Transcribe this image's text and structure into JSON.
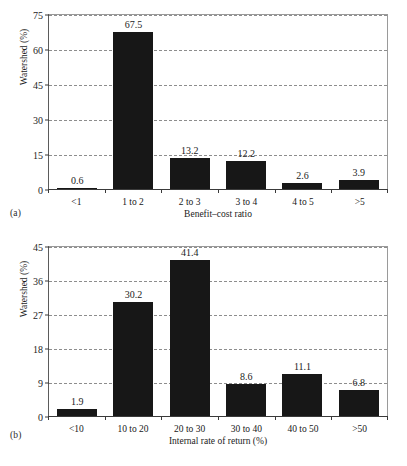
{
  "chart_data": [
    {
      "type": "bar",
      "panel": "(a)",
      "title": "",
      "categories": [
        "<1",
        "1 to 2",
        "2 to 3",
        "3 to 4",
        "4 to 5",
        ">5"
      ],
      "values": [
        0.6,
        67.5,
        13.2,
        12.2,
        2.6,
        3.9
      ],
      "value_labels": [
        "0.6",
        "67.5",
        "13.2",
        "12.2",
        "2.6",
        "3.9"
      ],
      "xlabel": "Benefit–cost ratio",
      "ylabel": "Watershed (%)",
      "ylim": [
        0,
        75
      ],
      "yticks": [
        0,
        15,
        30,
        45,
        60,
        75
      ],
      "ytick_labels": [
        "0",
        "15",
        "30",
        "45",
        "60",
        "75"
      ],
      "grid": true,
      "legend": "none",
      "bar_color": "#171717"
    },
    {
      "type": "bar",
      "panel": "(b)",
      "title": "",
      "categories": [
        "<10",
        "10 to 20",
        "20 to 30",
        "30 to 40",
        "40 to 50",
        ">50"
      ],
      "values": [
        1.9,
        30.2,
        41.4,
        8.6,
        11.1,
        6.8
      ],
      "value_labels": [
        "1.9",
        "30.2",
        "41.4",
        "8.6",
        "11.1",
        "6.8"
      ],
      "xlabel": "Internal rate of return (%)",
      "ylabel": "Watershed (%)",
      "ylim": [
        0,
        45
      ],
      "yticks": [
        0,
        9,
        18,
        27,
        36,
        45
      ],
      "ytick_labels": [
        "0",
        "9",
        "18",
        "27",
        "36",
        "45"
      ],
      "grid": true,
      "legend": "none",
      "bar_color": "#171717"
    }
  ]
}
